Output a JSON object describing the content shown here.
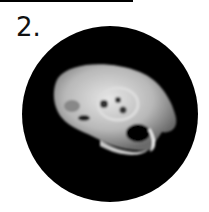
{
  "figure": {
    "label": "2.",
    "image_description": "rodent skull on black circular background",
    "colors": {
      "background": "#000000",
      "bone": "#d8d8d8",
      "line": "#000000"
    }
  }
}
